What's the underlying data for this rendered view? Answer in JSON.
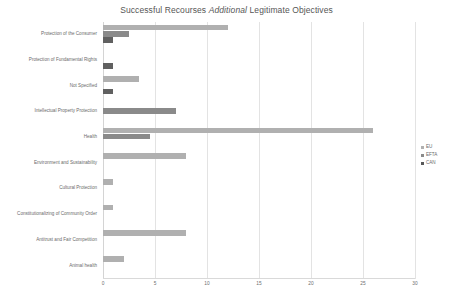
{
  "chart_data": {
    "type": "bar",
    "orientation": "horizontal",
    "title": "Successful Recourses Additional Legitimate Objectives",
    "title_plain_prefix": "Successful Recourses ",
    "title_italic": "Additional",
    "title_plain_suffix": " Legitimate Objectives",
    "xlabel": "",
    "ylabel": "",
    "xlim": [
      0,
      30
    ],
    "xticks": [
      0,
      5,
      10,
      15,
      20,
      25,
      30
    ],
    "xtick_labels": [
      "0",
      "5",
      "10",
      "15",
      "20",
      "25",
      "30"
    ],
    "grid": true,
    "legend_position": "right",
    "categories": [
      "Protection of the Consumer",
      "Protection of Fundamental Rights",
      "Not Specified",
      "Intellectual Property Protection",
      "Health",
      "Environment and Sustainability",
      "Cultural Protection",
      "Constitutionalizing of Community Order",
      "Antitrust and Fair Competition",
      "Animal health"
    ],
    "series": [
      {
        "name": "EU",
        "color": "#b0b0b0",
        "values": [
          12,
          0,
          3.5,
          0,
          26,
          8,
          1,
          1,
          8,
          2
        ]
      },
      {
        "name": "EFTA",
        "color": "#8a8a8a",
        "values": [
          2.5,
          0,
          0,
          7,
          4.5,
          0,
          0,
          0,
          0,
          0
        ]
      },
      {
        "name": "CAN",
        "color": "#585858",
        "values": [
          1,
          1,
          1,
          0,
          0,
          0,
          0,
          0,
          0,
          0
        ]
      }
    ]
  },
  "legend": {
    "items": [
      {
        "label": "EU",
        "key": "eu"
      },
      {
        "label": "EFTA",
        "key": "efta"
      },
      {
        "label": "CAN",
        "key": "can"
      }
    ]
  }
}
